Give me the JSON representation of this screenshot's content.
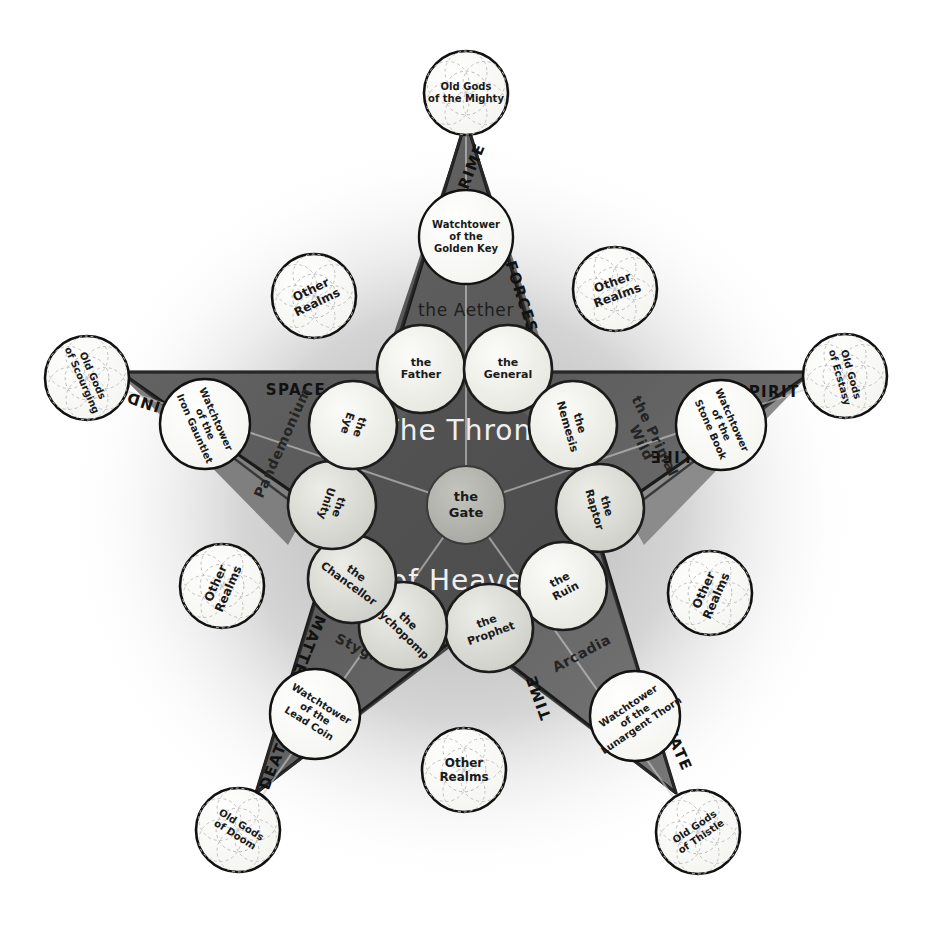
{
  "diagram": {
    "title_line1": "The Throne",
    "title_line2": "of Heaven",
    "center_node": "the Gate",
    "aether_label": "the Aether",
    "colors": {
      "paper": "#ffffff",
      "star_fill_dark": "#4a4a4a",
      "star_fill_mid": "#6e6e6e",
      "star_fill_light": "#8d8d8d",
      "node_fill_light": "#f2f2ee",
      "node_fill_shaded": "#dcdcd6",
      "center_fill": "#b4b4ae",
      "ink": "#141414",
      "throne_text": "#efefef"
    }
  },
  "arcana": [
    {
      "name": "PRIME",
      "x": 470,
      "y": 172,
      "rot": -68
    },
    {
      "name": "FORCES",
      "x": 521,
      "y": 297,
      "rot": 72
    },
    {
      "name": "SPIRIT",
      "x": 768,
      "y": 392,
      "rot": 0
    },
    {
      "name": "LIFE",
      "x": 670,
      "y": 455,
      "rot": 180
    },
    {
      "name": "FATE",
      "x": 678,
      "y": 750,
      "rot": 66
    },
    {
      "name": "TIME",
      "x": 539,
      "y": 697,
      "rot": 250
    },
    {
      "name": "DEATH",
      "x": 276,
      "y": 760,
      "rot": 292
    },
    {
      "name": "MATTER",
      "x": 306,
      "y": 651,
      "rot": 112
    },
    {
      "name": "MIND",
      "x": 151,
      "y": 404,
      "rot": 198
    },
    {
      "name": "SPACE",
      "x": 296,
      "y": 390,
      "rot": 0
    }
  ],
  "realms": [
    {
      "name": "the Aether",
      "x": 466,
      "y": 311,
      "rot": 0
    },
    {
      "name": "the Primal Wild",
      "x": 647,
      "y": 440,
      "rot": 64
    },
    {
      "name": "Arcadia",
      "x": 582,
      "y": 654,
      "rot": -28
    },
    {
      "name": "Stygia",
      "x": 360,
      "y": 650,
      "rot": 26
    },
    {
      "name": "Pandemonium",
      "x": 283,
      "y": 443,
      "rot": -66
    }
  ],
  "ruling_nodes": [
    {
      "label_lines": [
        "the",
        "Father"
      ],
      "x": 421,
      "y": 369,
      "r": 44,
      "rot": 0,
      "shade": "light"
    },
    {
      "label_lines": [
        "the",
        "General"
      ],
      "x": 508,
      "y": 369,
      "r": 44,
      "rot": 0,
      "shade": "light"
    },
    {
      "label_lines": [
        "the",
        "Nemesis"
      ],
      "x": 573,
      "y": 425,
      "r": 44,
      "rot": 74,
      "shade": "light"
    },
    {
      "label_lines": [
        "the",
        "Raptor"
      ],
      "x": 600,
      "y": 508,
      "r": 44,
      "rot": 74,
      "shade": "shaded"
    },
    {
      "label_lines": [
        "the",
        "Ruin"
      ],
      "x": 563,
      "y": 586,
      "r": 44,
      "rot": -28,
      "shade": "light"
    },
    {
      "label_lines": [
        "the",
        "Prophet"
      ],
      "x": 489,
      "y": 628,
      "r": 44,
      "rot": -20,
      "shade": "shaded"
    },
    {
      "label_lines": [
        "the",
        "Psychopomp"
      ],
      "x": 403,
      "y": 626,
      "r": 44,
      "rot": 44,
      "shade": "shaded"
    },
    {
      "label_lines": [
        "the",
        "Chancellor"
      ],
      "x": 352,
      "y": 579,
      "r": 44,
      "rot": 36,
      "shade": "shaded"
    },
    {
      "label_lines": [
        "the",
        "Unity"
      ],
      "x": 332,
      "y": 505,
      "r": 44,
      "rot": 108,
      "shade": "shaded"
    },
    {
      "label_lines": [
        "the",
        "Eye"
      ],
      "x": 353,
      "y": 425,
      "r": 44,
      "rot": 108,
      "shade": "light"
    }
  ],
  "watchtowers": [
    {
      "label_lines": [
        "Watchtower",
        "of the",
        "Golden Key"
      ],
      "x": 466,
      "y": 237,
      "r": 47,
      "rot": 0
    },
    {
      "label_lines": [
        "Watchtower",
        "of the",
        "Stone Book"
      ],
      "x": 721,
      "y": 425,
      "r": 45,
      "rot": 66
    },
    {
      "label_lines": [
        "Watchtower",
        "of the",
        "Lunargent Thorn"
      ],
      "x": 635,
      "y": 716,
      "r": 45,
      "rot": -34
    },
    {
      "label_lines": [
        "Watchtower",
        "of the",
        "Lead Coin"
      ],
      "x": 315,
      "y": 714,
      "r": 45,
      "rot": 32
    },
    {
      "label_lines": [
        "Watchtower",
        "of the",
        "Iron Gauntlet"
      ],
      "x": 205,
      "y": 424,
      "r": 45,
      "rot": 66
    }
  ],
  "old_gods": [
    {
      "label_lines": [
        "Old Gods",
        "of the Mighty"
      ],
      "x": 466,
      "y": 93,
      "r": 42,
      "rot": 0
    },
    {
      "label_lines": [
        "Old Gods",
        "of Ecstasy"
      ],
      "x": 845,
      "y": 376,
      "r": 42,
      "rot": 74
    },
    {
      "label_lines": [
        "Old Gods",
        "of Thistle"
      ],
      "x": 698,
      "y": 832,
      "r": 42,
      "rot": -34
    },
    {
      "label_lines": [
        "Old Gods",
        "of Doom"
      ],
      "x": 238,
      "y": 830,
      "r": 42,
      "rot": 32
    },
    {
      "label_lines": [
        "Old Gods",
        "of Scourging"
      ],
      "x": 87,
      "y": 378,
      "r": 42,
      "rot": 66
    }
  ],
  "other_realms": [
    {
      "label_lines": [
        "Other",
        "Realms"
      ],
      "x": 314,
      "y": 296,
      "r": 42,
      "rot": -26
    },
    {
      "label_lines": [
        "Other",
        "Realms"
      ],
      "x": 615,
      "y": 289,
      "r": 42,
      "rot": -20
    },
    {
      "label_lines": [
        "Other",
        "Realms"
      ],
      "x": 710,
      "y": 593,
      "r": 42,
      "rot": -66
    },
    {
      "label_lines": [
        "Other",
        "Realms"
      ],
      "x": 464,
      "y": 770,
      "r": 42,
      "rot": 0
    },
    {
      "label_lines": [
        "Other",
        "Realms"
      ],
      "x": 222,
      "y": 586,
      "r": 42,
      "rot": -66
    }
  ]
}
